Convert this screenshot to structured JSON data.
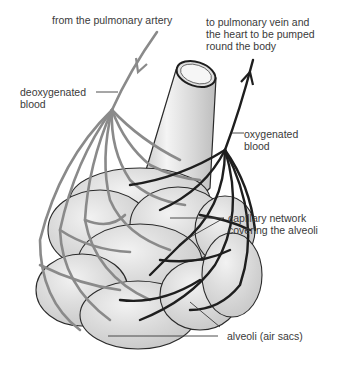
{
  "diagram": {
    "labels": {
      "pulmonary_artery": "from the pulmonary artery",
      "pulmonary_vein": "to pulmonary vein and\nthe heart to be pumped\nround the body",
      "deoxygenated": "deoxygenated\nblood",
      "oxygenated": "oxygenated\nblood",
      "capillary": "capillary network\ncovering the alveoli",
      "alveoli": "alveoli (air sacs)"
    },
    "colors": {
      "deoxygenated_vessel": "#8a8a8a",
      "oxygenated_vessel": "#1e1e1e",
      "alveolus_fill": "#d9d9d9",
      "alveolus_outline": "#2a2a2a",
      "bronchiole_fill": "#d6d6d6",
      "label_text": "#3a3a3a",
      "leader_line": "#3a3a3a"
    }
  }
}
